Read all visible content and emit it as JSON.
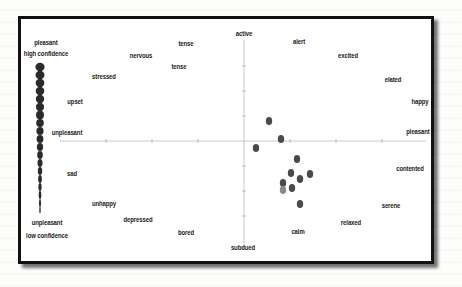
{
  "figure": {
    "left_scale": {
      "top_label": "pleasant",
      "top_sublabel": "high confidence",
      "bottom_label": "unpleasant",
      "bottom_sublabel": "low confidence"
    },
    "axes": {
      "top": "active",
      "bottom": "subdued",
      "right": "pleasant",
      "left": "unpleasant"
    },
    "emotion_labels": [
      {
        "text": "tense",
        "x": 186,
        "y": 43
      },
      {
        "text": "nervous",
        "x": 141,
        "y": 55
      },
      {
        "text": "tense",
        "x": 179,
        "y": 66
      },
      {
        "text": "stressed",
        "x": 104,
        "y": 76
      },
      {
        "text": "upset",
        "x": 75,
        "y": 101
      },
      {
        "text": "unpleasant",
        "x": 67,
        "y": 132
      },
      {
        "text": "sad",
        "x": 72,
        "y": 173
      },
      {
        "text": "unhappy",
        "x": 104,
        "y": 203
      },
      {
        "text": "depressed",
        "x": 138,
        "y": 219
      },
      {
        "text": "bored",
        "x": 186,
        "y": 232
      },
      {
        "text": "subdued",
        "x": 243,
        "y": 247
      },
      {
        "text": "active",
        "x": 244,
        "y": 33
      },
      {
        "text": "alert",
        "x": 299,
        "y": 41
      },
      {
        "text": "excited",
        "x": 348,
        "y": 55
      },
      {
        "text": "elated",
        "x": 393,
        "y": 79
      },
      {
        "text": "happy",
        "x": 420,
        "y": 101
      },
      {
        "text": "pleasant",
        "x": 418,
        "y": 131
      },
      {
        "text": "contented",
        "x": 410,
        "y": 168
      },
      {
        "text": "serene",
        "x": 391,
        "y": 205
      },
      {
        "text": "relaxed",
        "x": 351,
        "y": 222
      },
      {
        "text": "calm",
        "x": 298,
        "y": 231
      }
    ],
    "corner_labels": [
      {
        "text": "pleasant",
        "x": 46,
        "y": 42
      },
      {
        "text": "high confidence",
        "x": 46,
        "y": 53
      },
      {
        "text": "unpleasant",
        "x": 47,
        "y": 222
      },
      {
        "text": "low confidence",
        "x": 47,
        "y": 235
      }
    ],
    "data_points": [
      {
        "x": 269,
        "y": 121
      },
      {
        "x": 281,
        "y": 139
      },
      {
        "x": 256,
        "y": 148
      },
      {
        "x": 297,
        "y": 159
      },
      {
        "x": 291,
        "y": 173
      },
      {
        "x": 300,
        "y": 179
      },
      {
        "x": 310,
        "y": 174
      },
      {
        "x": 283,
        "y": 183
      },
      {
        "x": 283,
        "y": 190
      },
      {
        "x": 292,
        "y": 188
      },
      {
        "x": 300,
        "y": 204
      }
    ],
    "colors": {
      "frame": "#111111",
      "dot": "#4a4a4a",
      "axis": "#b8b8b8",
      "text": "#222222"
    }
  }
}
